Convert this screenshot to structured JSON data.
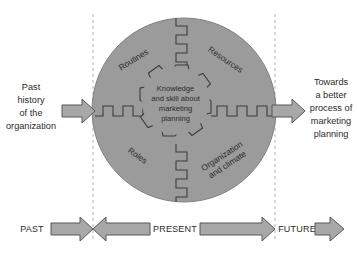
{
  "diagram": {
    "type": "process-diagram",
    "colors": {
      "circle_fill": "#9b9b9b",
      "circle_stroke": "#6f6f6f",
      "gear_fill": "#9b9b9b",
      "gear_stroke": "#3d3d3d",
      "arrow_fill": "#a8a8a8",
      "arrow_stroke": "#575757",
      "band_stroke": "#3d3d3d",
      "dashed_line": "#b0b0b0",
      "text": "#2b2b2b",
      "background": "#ffffff"
    },
    "left_input": {
      "label_lines": [
        "Past",
        "history",
        "of the",
        "organization"
      ],
      "arrow_direction": "right"
    },
    "right_output": {
      "label_lines": [
        "Towards",
        "a better",
        "process of",
        "marketing",
        "planning"
      ],
      "arrow_direction": "right"
    },
    "core": {
      "label_lines": [
        "Knowledge",
        "and skill about",
        "marketing",
        "planning"
      ]
    },
    "spokes": [
      {
        "label_lines": [
          "Routines"
        ],
        "position": "top-left",
        "rotation": -32
      },
      {
        "label_lines": [
          "Resources"
        ],
        "position": "top-right",
        "rotation": 34
      },
      {
        "label_lines": [
          "Roles"
        ],
        "position": "bottom-left",
        "rotation": 36
      },
      {
        "label_lines": [
          "Organization",
          "and climate"
        ],
        "position": "bottom-right",
        "rotation": -33
      }
    ],
    "timeline": {
      "segments": [
        {
          "label": "PAST",
          "arrows": [
            "right",
            "left"
          ]
        },
        {
          "label": "PRESENT",
          "arrows": [
            "right"
          ]
        },
        {
          "label": "FUTURE",
          "arrows": [
            "right"
          ]
        }
      ]
    },
    "dividers": {
      "count": 2,
      "style": "dashed"
    }
  }
}
